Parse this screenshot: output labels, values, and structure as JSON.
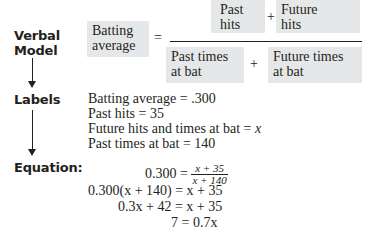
{
  "steps": {
    "verbal_model": "Verbal\nModel",
    "verbal_model_line1": "Verbal",
    "verbal_model_line2": "Model",
    "labels": "Labels",
    "equation": "Equation:"
  },
  "verbal_model": {
    "lhs_line1": "Batting",
    "lhs_line2": "average",
    "equals": "=",
    "numerator": {
      "term1_line1": "Past",
      "term1_line2": "hits",
      "plus": "+",
      "term2_line1": "Future",
      "term2_line2": "hits"
    },
    "denominator": {
      "term1_line1": "Past times",
      "term1_line2": "at bat",
      "plus": "+",
      "term2_line1": "Future times",
      "term2_line2": "at bat"
    },
    "box_color": "#e6e7e8"
  },
  "labels": [
    {
      "name": "Batting average",
      "value": ".300"
    },
    {
      "name": "Past hits",
      "value": "35"
    },
    {
      "name": "Future hits and times at bat",
      "value": "x"
    },
    {
      "name": "Past times at bat",
      "value": "140"
    }
  ],
  "equations": {
    "eq1_lhs": "0.300 =",
    "eq1_num": "x + 35",
    "eq1_den": "x + 140",
    "eq2": "0.300(x + 140) = x + 35",
    "eq3": "0.3x + 42 = x + 35",
    "eq4": "7 = 0.7x"
  }
}
